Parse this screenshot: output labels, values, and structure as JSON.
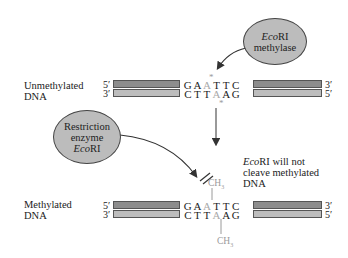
{
  "methylase": {
    "line1_italic": "Eco",
    "line1_rest": "RI",
    "line2": "methylase"
  },
  "unmethylated": {
    "label_line1": "Unmethylated",
    "label_line2": "DNA",
    "top_5": "5′",
    "top_3": "3′",
    "bottom_3": "3′",
    "bottom_5": "5′",
    "top_seq": [
      "G",
      "A",
      "A",
      "T",
      "T",
      "C"
    ],
    "bottom_seq": [
      "C",
      "T",
      "T",
      "A",
      "A",
      "G"
    ],
    "star": "*"
  },
  "restriction": {
    "line1": "Restriction",
    "line2": "enzyme",
    "line3_italic": "Eco",
    "line3_rest": "RI"
  },
  "note": {
    "line1_italic": "Eco",
    "line1_rest": "RI will not",
    "line2": "cleave methylated",
    "line3": "DNA"
  },
  "methylated": {
    "label_line1": "Methylated",
    "label_line2": "DNA",
    "top_5": "5′",
    "top_3": "3′",
    "bottom_3": "3′",
    "bottom_5": "5′",
    "top_seq": [
      "G",
      "A",
      "A",
      "T",
      "T",
      "C"
    ],
    "bottom_seq": [
      "C",
      "T",
      "T",
      "A",
      "A",
      "G"
    ],
    "ch3": "CH",
    "ch3_sub": "3"
  },
  "colors": {
    "ellipse_fill": "#bcbcbc",
    "strand_dark": "#8d8d8d",
    "strand_light": "#bdbdbd",
    "methyl_gray": "#a9a9a9"
  }
}
